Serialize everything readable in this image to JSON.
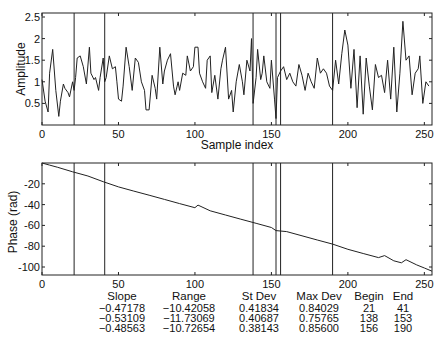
{
  "chart_data": [
    {
      "type": "line",
      "title": "",
      "xlabel": "Sample index",
      "ylabel": "Amplitude",
      "xlim": [
        0,
        255
      ],
      "ylim": [
        0,
        2.6
      ],
      "xticks": [
        0,
        50,
        100,
        150,
        200,
        250
      ],
      "yticks": [
        0.5,
        1,
        1.5,
        2,
        2.5
      ],
      "ytick_labels": [
        "0.5",
        "1",
        "1.5",
        "2",
        "2.5"
      ],
      "grid": false,
      "vertical_markers": [
        21,
        41,
        138,
        153,
        156,
        190
      ],
      "series": [
        {
          "name": "amplitude",
          "x": [
            0,
            2,
            4,
            5,
            7,
            9,
            11,
            12,
            14,
            15,
            17,
            18,
            20,
            21,
            22,
            23,
            25,
            27,
            29,
            31,
            32,
            34,
            35,
            37,
            38,
            40,
            41,
            42,
            44,
            46,
            48,
            49,
            50,
            52,
            53,
            55,
            57,
            59,
            61,
            63,
            65,
            67,
            68,
            70,
            72,
            74,
            75,
            77,
            79,
            80,
            82,
            84,
            86,
            87,
            89,
            90,
            92,
            94,
            95,
            97,
            99,
            100,
            102,
            103,
            105,
            107,
            108,
            110,
            111,
            113,
            115,
            117,
            118,
            120,
            122,
            124,
            125,
            127,
            129,
            131,
            132,
            134,
            136,
            137,
            138,
            140,
            141,
            143,
            144,
            145,
            147,
            149,
            150,
            152,
            153,
            154,
            156,
            158,
            160,
            162,
            164,
            166,
            168,
            170,
            172,
            174,
            176,
            178,
            180,
            182,
            184,
            186,
            188,
            190,
            192,
            194,
            196,
            198,
            200,
            202,
            204,
            206,
            208,
            210,
            212,
            214,
            216,
            218,
            220,
            222,
            224,
            226,
            228,
            230,
            232,
            234,
            236,
            238,
            240,
            242,
            244,
            246,
            247,
            249,
            251,
            253,
            254,
            255
          ],
          "y": [
            1.05,
            0.55,
            0.3,
            1.2,
            1.75,
            0.8,
            0.2,
            0.55,
            0.95,
            0.85,
            0.75,
            0.65,
            1.0,
            0.8,
            1.1,
            1.55,
            1.6,
            1.35,
            0.95,
            1.8,
            1.2,
            1.05,
            1.1,
            0.8,
            1.1,
            1.55,
            1.0,
            1.1,
            1.6,
            1.3,
            1.35,
            1.0,
            0.6,
            0.55,
            0.9,
            1.8,
            1.35,
            0.8,
            1.55,
            1.45,
            1.0,
            0.8,
            0.35,
            0.35,
            1.15,
            0.85,
            0.6,
            1.8,
            0.95,
            1.25,
            1.5,
            1.65,
            0.9,
            0.7,
            1.0,
            0.8,
            1.2,
            1.15,
            1.6,
            1.25,
            1.35,
            1.8,
            1.8,
            1.2,
            1.0,
            0.85,
            1.5,
            1.6,
            0.75,
            1.15,
            0.6,
            1.3,
            1.5,
            1.8,
            0.6,
            0.8,
            0.3,
            1.0,
            1.4,
            1.0,
            0.7,
            1.5,
            1.25,
            2.0,
            0.5,
            1.1,
            1.75,
            1.05,
            1.2,
            1.6,
            1.0,
            0.85,
            1.5,
            0.6,
            0.15,
            1.1,
            1.25,
            1.35,
            1.05,
            1.2,
            1.0,
            0.9,
            1.4,
            1.15,
            0.8,
            1.2,
            1.0,
            0.85,
            1.55,
            1.2,
            1.3,
            1.2,
            0.9,
            0.8,
            1.5,
            0.95,
            1.65,
            2.2,
            1.85,
            0.85,
            1.75,
            0.4,
            1.6,
            0.25,
            1.55,
            0.9,
            0.35,
            1.4,
            1.1,
            1.15,
            0.75,
            1.5,
            0.6,
            1.8,
            0.3,
            1.2,
            2.4,
            1.5,
            1.6,
            0.7,
            1.2,
            1.3,
            1.6,
            0.5,
            1.0,
            0.9
          ]
        }
      ]
    },
    {
      "type": "line",
      "title": "",
      "xlabel": "",
      "ylabel": "Phase (rad)",
      "xlim": [
        0,
        255
      ],
      "ylim": [
        -108,
        0
      ],
      "xticks": [
        0,
        50,
        100,
        150,
        200,
        250
      ],
      "yticks": [
        -20,
        -40,
        -60,
        -80,
        -100
      ],
      "ytick_labels": [
        "-20",
        "-40",
        "-60",
        "-80",
        "-100"
      ],
      "grid": false,
      "vertical_markers": [
        21,
        41,
        138,
        153,
        156,
        190
      ],
      "series": [
        {
          "name": "phase",
          "x": [
            0,
            5,
            10,
            20,
            30,
            40,
            50,
            60,
            70,
            80,
            90,
            100,
            102,
            110,
            120,
            130,
            140,
            150,
            153,
            160,
            170,
            180,
            190,
            200,
            210,
            220,
            224,
            230,
            235,
            238,
            245,
            250,
            255
          ],
          "y": [
            0,
            -2,
            -4,
            -8.5,
            -12.5,
            -18,
            -23,
            -27,
            -31,
            -35,
            -39,
            -43,
            -40.5,
            -46,
            -50,
            -54,
            -58,
            -62,
            -65,
            -66,
            -70,
            -74,
            -78,
            -83,
            -87,
            -91,
            -89,
            -94,
            -96,
            -93,
            -98,
            -101,
            -104
          ]
        }
      ]
    }
  ],
  "top_plot": {
    "ylabel": "Amplitude",
    "xlabel": "Sample index",
    "xtick_labels": [
      "0",
      "50",
      "100",
      "150",
      "200",
      "250"
    ],
    "ytick_labels": [
      "0.5",
      "1",
      "1.5",
      "2",
      "2.5"
    ]
  },
  "bottom_plot": {
    "ylabel": "Phase (rad)",
    "xtick_labels": [
      "0",
      "50",
      "100",
      "150",
      "200",
      "250"
    ],
    "ytick_labels": [
      "-20",
      "-40",
      "-60",
      "-80",
      "-100"
    ]
  },
  "stats_table": {
    "headers": [
      "Slope",
      "Range",
      "St Dev",
      "Max Dev",
      "Begin",
      "End"
    ],
    "rows": [
      [
        "−0.47178",
        "−10.42058",
        "0.41834",
        "0.84029",
        "21",
        "41"
      ],
      [
        "−0.53109",
        "−11.73069",
        "0.40687",
        "0.75765",
        "138",
        "153"
      ],
      [
        "−0.48563",
        "−10.72654",
        "0.38143",
        "0.85600",
        "156",
        "190"
      ]
    ]
  }
}
